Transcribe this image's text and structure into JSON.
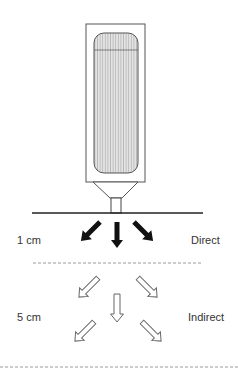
{
  "diagram": {
    "device": {
      "description": "vertical device with rounded inner canister and funnel nozzle",
      "stroke_color": "#555555",
      "fill_color": "#d9d9d9"
    },
    "zones": [
      {
        "distance_label": "1 cm",
        "type_label": "Direct",
        "arrow_style": "solid-filled",
        "arrow_count": 3
      },
      {
        "distance_label": "5 cm",
        "type_label": "Indirect",
        "arrow_style": "hollow-outline",
        "arrow_count": 5
      }
    ],
    "colors": {
      "line": "#222222",
      "dash": "#999999",
      "text": "#333333"
    }
  }
}
